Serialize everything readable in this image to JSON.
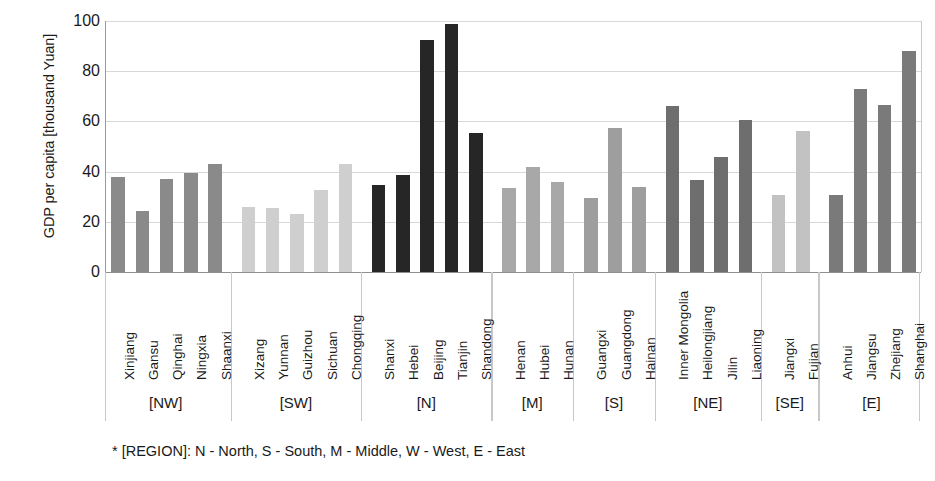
{
  "chart_data": {
    "type": "bar",
    "title": "",
    "xlabel": "",
    "ylabel": "GDP per capita [thousand Yuan]",
    "ylim": [
      0,
      100
    ],
    "yticks": [
      0,
      20,
      40,
      60,
      80,
      100
    ],
    "grid": true,
    "legend": "none",
    "categories": [
      "Xinjiang",
      "Gansu",
      "Qinghai",
      "Ningxia",
      "Shaanxi",
      "Xizang",
      "Yunnan",
      "Guizhou",
      "Sichuan",
      "Chongqing",
      "Shanxi",
      "Hebei",
      "Beijing",
      "Tianjin",
      "Shandong",
      "Henan",
      "Hubei",
      "Hunan",
      "Guangxi",
      "Guangdong",
      "Hainan",
      "Inner Mongolia",
      "Heilongjiang",
      "Jilin",
      "Liaoning",
      "Jiangxi",
      "Fujian",
      "Anhui",
      "Jiangsu",
      "Zhejiang",
      "Shanghai"
    ],
    "values": [
      38,
      24.5,
      37,
      39.5,
      43,
      26,
      25.5,
      23,
      32.5,
      43,
      34.5,
      38.5,
      92.5,
      99,
      55.5,
      33.5,
      42,
      36,
      29.5,
      57.5,
      34,
      66,
      36.5,
      46,
      60.5,
      30.5,
      56,
      30.5,
      73,
      66.5,
      88
    ],
    "bar_colors": [
      "#8a8a8a",
      "#8a8a8a",
      "#8a8a8a",
      "#8a8a8a",
      "#8a8a8a",
      "#cfcfcf",
      "#cfcfcf",
      "#cfcfcf",
      "#cfcfcf",
      "#cfcfcf",
      "#262626",
      "#262626",
      "#262626",
      "#262626",
      "#262626",
      "#a8a8a8",
      "#a8a8a8",
      "#a8a8a8",
      "#9e9e9e",
      "#9e9e9e",
      "#9e9e9e",
      "#6e6e6e",
      "#6e6e6e",
      "#6e6e6e",
      "#6e6e6e",
      "#c2c2c2",
      "#c2c2c2",
      "#7a7a7a",
      "#7a7a7a",
      "#7a7a7a",
      "#7a7a7a"
    ],
    "groups": [
      {
        "label": "[NW]",
        "count": 5
      },
      {
        "label": "[SW]",
        "count": 5
      },
      {
        "label": "[N]",
        "count": 5
      },
      {
        "label": "[M]",
        "count": 3
      },
      {
        "label": "[S]",
        "count": 3
      },
      {
        "label": "[NE]",
        "count": 4
      },
      {
        "label": "[SE]",
        "count": 2
      },
      {
        "label": "[E]",
        "count": 4
      }
    ],
    "footnote": "* [REGION]: N - North, S - South, M - Middle, W - West, E - East"
  }
}
